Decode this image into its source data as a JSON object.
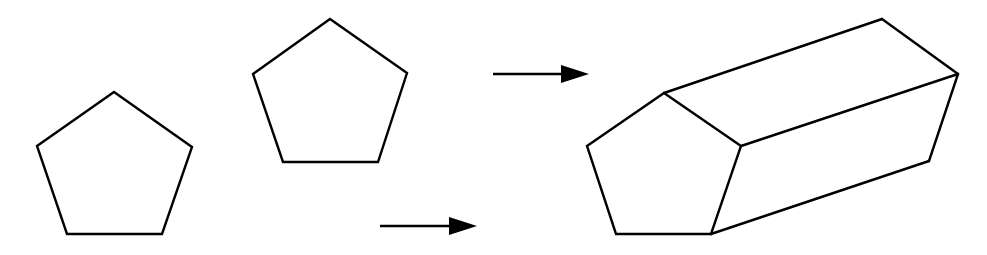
{
  "diagram": {
    "colors": {
      "stroke": "#000000",
      "background": "#ffffff"
    },
    "pentagon_left": {
      "points": [
        [
          114,
          92
        ],
        [
          192,
          147
        ],
        [
          162,
          234
        ],
        [
          67,
          234
        ],
        [
          37,
          146
        ]
      ]
    },
    "pentagon_top": {
      "points": [
        [
          330,
          19
        ],
        [
          407,
          73
        ],
        [
          378,
          162
        ],
        [
          283,
          162
        ],
        [
          253,
          74
        ]
      ]
    },
    "arrow_top": {
      "x1": 493,
      "x2": 589,
      "y": 74,
      "head_length": 28,
      "head_half_height": 9
    },
    "arrow_bottom": {
      "x1": 380,
      "x2": 477,
      "y": 226,
      "head_length": 28,
      "head_half_height": 9
    },
    "prism": {
      "front_face": [
        [
          664,
          93
        ],
        [
          741,
          146
        ],
        [
          711,
          234
        ],
        [
          616,
          234
        ],
        [
          587,
          146
        ]
      ],
      "back_top": [
        882,
        19
      ],
      "back_right": [
        958,
        74
      ],
      "back_bottom_right": [
        929,
        161
      ],
      "lateral_edges": [
        [
          [
            664,
            93
          ],
          [
            882,
            19
          ]
        ],
        [
          [
            741,
            146
          ],
          [
            958,
            74
          ]
        ],
        [
          [
            711,
            234
          ],
          [
            929,
            161
          ]
        ]
      ],
      "back_edges": [
        [
          [
            882,
            19
          ],
          [
            958,
            74
          ]
        ],
        [
          [
            958,
            74
          ],
          [
            929,
            161
          ]
        ]
      ]
    }
  }
}
